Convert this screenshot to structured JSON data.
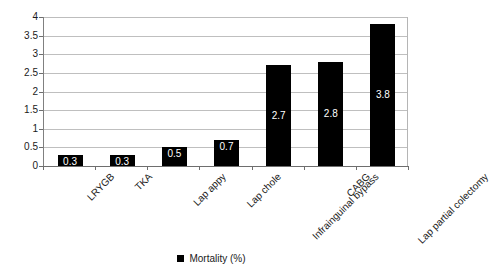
{
  "chart_data": {
    "type": "bar",
    "title": "",
    "subtitle": "",
    "xlabel": "",
    "ylabel": "",
    "categories": [
      "LRYGB",
      "TKA",
      "Lap appy",
      "Lap chole",
      "Infrainguinal bypass",
      "CABG",
      "Lap partial colectomy"
    ],
    "series": [
      {
        "name": "Mortality (%)",
        "values": [
          0.3,
          0.3,
          0.5,
          0.7,
          2.7,
          2.8,
          3.8
        ],
        "labels": [
          "0.3",
          "0.3",
          "0.5",
          "0.7",
          "2.7",
          "2.8",
          "3.8"
        ],
        "color": "#000000"
      }
    ],
    "ylim": [
      0,
      4
    ],
    "yticks": [
      0,
      0.5,
      1,
      1.5,
      2,
      2.5,
      3,
      3.5,
      4
    ],
    "ytick_labels": [
      "0",
      "0.5",
      "1",
      "1.5",
      "2",
      "2.5",
      "3",
      "3.5",
      "4"
    ],
    "grid": true,
    "grid_axis": "y",
    "legend_position": "bottom",
    "legend_entries": [
      {
        "label": "Mortality (%)",
        "swatch": "legend-swatch-icon",
        "color": "#000000"
      }
    ],
    "background": "#ffffff",
    "gridline_color": "#bfbfbf",
    "axis_color": "#6e6e6e",
    "data_label_color": "#ffffff"
  }
}
